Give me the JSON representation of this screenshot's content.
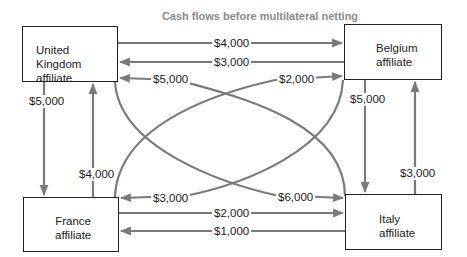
{
  "title": "Cash flows before multilateral netting",
  "colors": {
    "arrow": "#7a7a7a",
    "box_border": "#222222",
    "title": "#8a8a8a",
    "text": "#1a1a1a"
  },
  "nodes": {
    "uk": {
      "line1": "United Kingdom",
      "line2": "affiliate"
    },
    "belgium": {
      "line1": "Belgium",
      "line2": "affiliate"
    },
    "france": {
      "line1": "France",
      "line2": "affiliate"
    },
    "italy": {
      "line1": "Italy",
      "line2": "affiliate"
    }
  },
  "flows": {
    "uk_to_belgium": {
      "from": "United Kingdom",
      "to": "Belgium",
      "amount": "$4,000"
    },
    "belgium_to_uk": {
      "from": "Belgium",
      "to": "United Kingdom",
      "amount": "$3,000"
    },
    "italy_to_uk": {
      "from": "Italy",
      "to": "United Kingdom",
      "amount": "$5,000"
    },
    "france_to_belgium": {
      "from": "France",
      "to": "Belgium",
      "amount": "$2,000"
    },
    "uk_to_france": {
      "from": "United Kingdom",
      "to": "France",
      "amount": "$5,000"
    },
    "france_to_uk": {
      "from": "France",
      "to": "United Kingdom",
      "amount": "$4,000"
    },
    "belgium_to_italy": {
      "from": "Belgium",
      "to": "Italy",
      "amount": "$5,000"
    },
    "italy_to_belgium": {
      "from": "Italy",
      "to": "Belgium",
      "amount": "$3,000"
    },
    "belgium_to_france": {
      "from": "Belgium",
      "to": "France",
      "amount": "$3,000"
    },
    "uk_to_italy": {
      "from": "United Kingdom",
      "to": "Italy",
      "amount": "$6,000"
    },
    "france_to_italy": {
      "from": "France",
      "to": "Italy",
      "amount": "$2,000"
    },
    "italy_to_france": {
      "from": "Italy",
      "to": "France",
      "amount": "$1,000"
    }
  }
}
